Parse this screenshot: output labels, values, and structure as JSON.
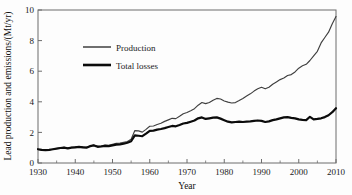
{
  "chart_data": {
    "type": "line",
    "title": "",
    "xlabel": "Year",
    "ylabel": "Lead production and emissions/(Mt/yr)",
    "xlim": [
      1930,
      2010
    ],
    "ylim": [
      0,
      10
    ],
    "xticks": [
      1930,
      1940,
      1950,
      1960,
      1970,
      1980,
      1990,
      2000,
      2010
    ],
    "xtick_labels": [
      "1930",
      "1940",
      "1950",
      "1960",
      "1970",
      "1980",
      "1990",
      "2000",
      "2010"
    ],
    "xminor_ticks": [
      1935,
      1945,
      1955,
      1965,
      1975,
      1985,
      1995,
      2005
    ],
    "yticks": [
      0,
      2,
      4,
      6,
      8,
      10
    ],
    "ytick_labels": [
      "0",
      "2",
      "4",
      "6",
      "8",
      "10"
    ],
    "grid": false,
    "legend_position": "upper-left-inside",
    "x": [
      1930,
      1931,
      1932,
      1933,
      1934,
      1935,
      1936,
      1937,
      1938,
      1939,
      1940,
      1941,
      1942,
      1943,
      1944,
      1945,
      1946,
      1947,
      1948,
      1949,
      1950,
      1951,
      1952,
      1953,
      1954,
      1955,
      1956,
      1957,
      1958,
      1959,
      1960,
      1961,
      1962,
      1963,
      1964,
      1965,
      1966,
      1967,
      1968,
      1969,
      1970,
      1971,
      1972,
      1973,
      1974,
      1975,
      1976,
      1977,
      1978,
      1979,
      1980,
      1981,
      1982,
      1983,
      1984,
      1985,
      1986,
      1987,
      1988,
      1989,
      1990,
      1991,
      1992,
      1993,
      1994,
      1995,
      1996,
      1997,
      1998,
      1999,
      2000,
      2001,
      2002,
      2003,
      2004,
      2005,
      2006,
      2007,
      2008,
      2009,
      2010
    ],
    "series": [
      {
        "name": "Production",
        "values": [
          0.88,
          0.84,
          0.82,
          0.85,
          0.9,
          0.95,
          1.0,
          1.02,
          0.98,
          1.02,
          1.05,
          1.08,
          1.05,
          1.02,
          1.12,
          1.18,
          1.1,
          1.12,
          1.18,
          1.15,
          1.22,
          1.28,
          1.3,
          1.35,
          1.4,
          1.55,
          2.12,
          2.1,
          2.02,
          2.2,
          2.4,
          2.42,
          2.52,
          2.6,
          2.72,
          2.82,
          2.92,
          2.9,
          3.05,
          3.22,
          3.3,
          3.42,
          3.55,
          3.78,
          3.95,
          3.88,
          3.95,
          4.1,
          4.22,
          4.18,
          4.05,
          3.98,
          3.92,
          3.95,
          4.08,
          4.22,
          4.38,
          4.52,
          4.7,
          4.85,
          4.95,
          4.85,
          4.95,
          5.15,
          5.3,
          5.45,
          5.55,
          5.72,
          5.78,
          5.95,
          6.2,
          6.35,
          6.45,
          6.7,
          7.0,
          7.3,
          7.85,
          8.2,
          8.55,
          9.1,
          9.58
        ]
      },
      {
        "name": "Total losses",
        "values": [
          0.9,
          0.86,
          0.84,
          0.86,
          0.9,
          0.94,
          0.98,
          1.0,
          0.96,
          1.0,
          1.02,
          1.05,
          1.02,
          1.0,
          1.1,
          1.15,
          1.06,
          1.08,
          1.12,
          1.1,
          1.15,
          1.2,
          1.22,
          1.26,
          1.32,
          1.42,
          1.8,
          1.78,
          1.75,
          1.92,
          2.1,
          2.12,
          2.18,
          2.22,
          2.28,
          2.35,
          2.42,
          2.4,
          2.48,
          2.58,
          2.62,
          2.7,
          2.78,
          2.92,
          2.98,
          2.88,
          2.92,
          2.96,
          2.98,
          2.9,
          2.8,
          2.7,
          2.65,
          2.68,
          2.7,
          2.68,
          2.7,
          2.72,
          2.75,
          2.78,
          2.75,
          2.68,
          2.72,
          2.8,
          2.85,
          2.92,
          2.98,
          3.0,
          2.95,
          2.92,
          2.85,
          2.82,
          2.8,
          3.02,
          2.85,
          2.88,
          2.92,
          3.0,
          3.12,
          3.32,
          3.58
        ]
      }
    ]
  },
  "legend": {
    "entries": [
      {
        "label": "Production",
        "style": "thin-line",
        "color": "#3f3f3f"
      },
      {
        "label": "Total losses",
        "style": "thick-line",
        "color": "#0b0b0b"
      }
    ]
  },
  "colors": {
    "production": "#3f3f3f",
    "losses": "#0b0b0b",
    "axis": "#6d6d6d",
    "text": "#1a1a1a",
    "background": "#fdfdfd"
  }
}
